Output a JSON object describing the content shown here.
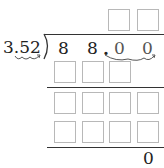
{
  "problem": {
    "divisor": "3.52",
    "dividend_digits": [
      "8",
      "8",
      ".",
      "0",
      "0"
    ],
    "remainder": "0",
    "quotient_boxes": 2,
    "work_rows": [
      {
        "boxes": 3
      },
      {
        "boxes": 4
      },
      {
        "boxes": 4
      }
    ]
  },
  "colors": {
    "box_border": "#b8b8b8",
    "text": "#222222",
    "line": "#333333"
  }
}
